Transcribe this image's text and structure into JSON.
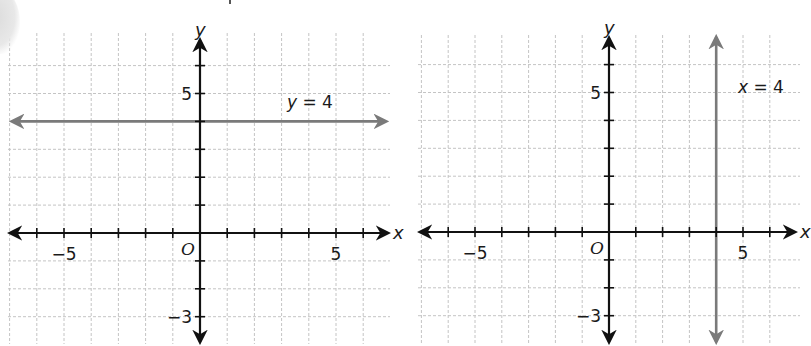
{
  "chart_data": [
    {
      "type": "line",
      "title": "",
      "equation_label": {
        "var": "y",
        "text": " = 4"
      },
      "line": {
        "kind": "horizontal",
        "value": 4,
        "color": "#7a7a7a"
      },
      "xlabel": "x",
      "ylabel": "y",
      "origin_label": "O",
      "xlim": [
        -7,
        7
      ],
      "ylim": [
        -4,
        6
      ],
      "x_tick_labels": [
        {
          "value": -5,
          "label": "−5"
        },
        {
          "value": 5,
          "label": "5"
        }
      ],
      "y_tick_labels": [
        {
          "value": 5,
          "label": "5"
        },
        {
          "value": -3,
          "label": "−3"
        }
      ],
      "grid": true,
      "frame": {
        "originX": 200,
        "originY": 233,
        "ux": 27.2,
        "uy": 27.9,
        "gridLeft": 8,
        "gridRight": 390,
        "gridTop": 33,
        "gridBottom": 344,
        "axisLeft": 10,
        "axisRight": 388,
        "axisTop": 40,
        "axisBottom": 342,
        "xTicks": [
          -6,
          -5,
          -4,
          -3,
          -2,
          -1,
          1,
          2,
          3,
          4,
          5,
          6
        ],
        "yTicks": [
          -3,
          -2,
          -1,
          1,
          2,
          3,
          4,
          5,
          6
        ],
        "gridX": [
          -7,
          -6,
          -5,
          -4,
          -3,
          -2,
          -1,
          1,
          2,
          3,
          4,
          5,
          6
        ],
        "gridY": [
          -3,
          -2,
          -1,
          1,
          2,
          3,
          5,
          6
        ],
        "eqX": 287,
        "eqY": 108
      }
    },
    {
      "type": "line",
      "title": "",
      "equation_label": {
        "var": "x",
        "text": " = 4"
      },
      "line": {
        "kind": "vertical",
        "value": 4,
        "color": "#7a7a7a"
      },
      "xlabel": "x",
      "ylabel": "y",
      "origin_label": "O",
      "xlim": [
        -7,
        7
      ],
      "ylim": [
        -4,
        6
      ],
      "x_tick_labels": [
        {
          "value": -5,
          "label": "−5"
        },
        {
          "value": 5,
          "label": "5"
        }
      ],
      "y_tick_labels": [
        {
          "value": 5,
          "label": "5"
        },
        {
          "value": -3,
          "label": "−3"
        }
      ],
      "grid": true,
      "frame": {
        "originX": 609,
        "originY": 232,
        "ux": 26.8,
        "uy": 27.9,
        "gridLeft": 418,
        "gridRight": 800,
        "gridTop": 35,
        "gridBottom": 344,
        "axisLeft": 420,
        "axisRight": 795,
        "axisTop": 38,
        "axisBottom": 342,
        "xTicks": [
          -6,
          -5,
          -4,
          -3,
          -2,
          -1,
          1,
          2,
          3,
          4,
          5,
          6
        ],
        "yTicks": [
          -3,
          -2,
          -1,
          1,
          2,
          3,
          4,
          5,
          6
        ],
        "gridX": [
          -7,
          -6,
          -5,
          -4,
          -3,
          -2,
          -1,
          1,
          2,
          3,
          5,
          6
        ],
        "gridY": [
          -3,
          -2,
          -1,
          1,
          2,
          3,
          4,
          5,
          6
        ],
        "eqX": 738,
        "eqY": 93
      }
    }
  ],
  "colors": {
    "axis": "#111111",
    "grid": "#c4c4c4",
    "graph_line": "#7a7a7a",
    "background": "#ffffff"
  }
}
